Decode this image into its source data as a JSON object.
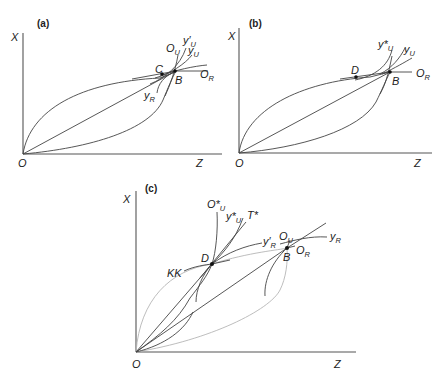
{
  "figure": {
    "panels": [
      {
        "id": "a",
        "panel_label": "(a)",
        "axis_y": "X",
        "axis_x": "Z",
        "origin": "O",
        "points": [
          "C",
          "B"
        ],
        "curves": {
          "OU": {
            "main": "O",
            "sub": "U"
          },
          "yU_prime": {
            "main": "y′",
            "sub": "U"
          },
          "yU": {
            "main": "y",
            "sub": "U"
          },
          "OR": {
            "main": "O",
            "sub": "R"
          },
          "yR": {
            "main": "y",
            "sub": "R"
          }
        }
      },
      {
        "id": "b",
        "panel_label": "(b)",
        "axis_y": "X",
        "axis_x": "Z",
        "origin": "O",
        "points": [
          "D",
          "B"
        ],
        "curves": {
          "yU_star": {
            "main": "y*",
            "sub": "U"
          },
          "yU": {
            "main": "y",
            "sub": "U"
          },
          "OR": {
            "main": "O",
            "sub": "R"
          }
        }
      },
      {
        "id": "c",
        "panel_label": "(c)",
        "axis_y": "X",
        "axis_x": "Z",
        "origin": "O",
        "points": [
          "D",
          "B"
        ],
        "curves": {
          "OU_star": {
            "main": "O*",
            "sub": "U"
          },
          "yU_star": {
            "main": "y*",
            "sub": "U"
          },
          "T_star": {
            "main": "T*",
            "sub": ""
          },
          "yR_prime": {
            "main": "y′",
            "sub": "R"
          },
          "OU": {
            "main": "O",
            "sub": "U"
          },
          "yR": {
            "main": "y",
            "sub": "R"
          },
          "OR": {
            "main": "O",
            "sub": "R"
          },
          "KK": {
            "main": "KK",
            "sub": ""
          }
        }
      }
    ]
  }
}
